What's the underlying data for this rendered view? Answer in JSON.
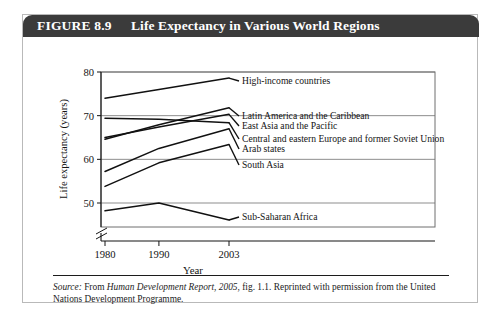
{
  "figure": {
    "number": "FIGURE 8.9",
    "title": "Life Expectancy in Various World Regions"
  },
  "source": {
    "label": "Source:",
    "text_before": " From ",
    "italic_work": "Human Development Report, 2005",
    "text_after": ", fig. 1.1. Reprinted with permission from the United Nations Development Programme."
  },
  "chart_data": {
    "type": "line",
    "title": "Life Expectancy in Various World Regions",
    "xlabel": "Year",
    "ylabel": "Life expectancy (years)",
    "x": [
      1980,
      1990,
      2003
    ],
    "xticklabels": [
      "1980",
      "1990",
      "2003"
    ],
    "yticklabels": [
      "50",
      "60",
      "70",
      "80"
    ],
    "yticks": [
      50,
      60,
      70,
      80
    ],
    "ylim": [
      45,
      80
    ],
    "xlim": [
      1977,
      2009
    ],
    "grid": true,
    "axis_break": true,
    "legend": "inline-right-labels",
    "series": [
      {
        "name": "High-income countries",
        "values": [
          74.0,
          76.0,
          78.6
        ]
      },
      {
        "name": "Latin America and the Caribbean",
        "values": [
          64.6,
          67.9,
          71.8
        ]
      },
      {
        "name": "East Asia and the Pacific",
        "values": [
          65.0,
          67.4,
          70.3
        ]
      },
      {
        "name": "Central and eastern Europe and former Soviet Union",
        "values": [
          69.4,
          69.2,
          68.4
        ]
      },
      {
        "name": "Arab states",
        "values": [
          57.2,
          62.5,
          67.0
        ]
      },
      {
        "name": "South Asia",
        "values": [
          53.8,
          59.2,
          63.4
        ]
      },
      {
        "name": "Sub-Saharan Africa",
        "values": [
          48.2,
          50.0,
          46.1
        ]
      }
    ]
  },
  "colors": {
    "header_bar": "#3b3b3b",
    "header_text": "#ffffff",
    "line": "#111111",
    "grid": "#8d8d8d",
    "frame": "#6e6e6e",
    "box_border": "#b9b9b9"
  }
}
